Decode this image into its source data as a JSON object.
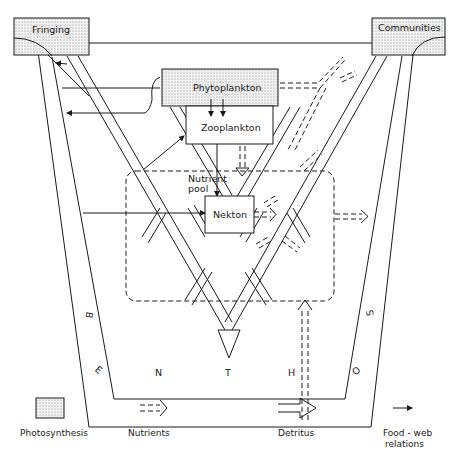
{
  "diagram": {
    "nodes": {
      "fringing": "Fringing",
      "communities": "Communities",
      "phytoplankton": "Phytoplankton",
      "zooplankton": "Zooplankton",
      "nutrient_pool": [
        "Nutrient",
        "pool"
      ],
      "nekton": "Nekton"
    },
    "benthos_letters": [
      "B",
      "E",
      "N",
      "T",
      "H",
      "O",
      "S"
    ]
  },
  "legend": {
    "photosynthesis": "Photosynthesis",
    "nutrients": "Nutrients",
    "detritus": "Detritus",
    "food_web": [
      "Food - web",
      "relations"
    ]
  },
  "colors": {
    "line": "#1a1a1a",
    "photo_fill": "#e6e6e6"
  }
}
